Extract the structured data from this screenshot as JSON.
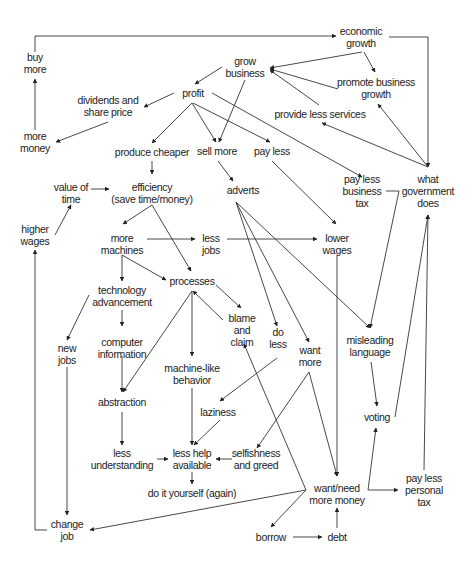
{
  "diagram": {
    "type": "causal-loop concept map",
    "nodes": [
      {
        "id": "economic_growth",
        "label": "economic\ngrowth",
        "x": 361,
        "y": 37
      },
      {
        "id": "buy_more",
        "label": "buy\nmore",
        "x": 35,
        "y": 63
      },
      {
        "id": "grow_business",
        "label": "grow\nbusiness",
        "x": 245,
        "y": 67
      },
      {
        "id": "promote_business_growth",
        "label": "promote business\ngrowth",
        "x": 376,
        "y": 88
      },
      {
        "id": "profit",
        "label": "profit",
        "x": 193,
        "y": 93
      },
      {
        "id": "dividends",
        "label": "dividends and\nshare price",
        "x": 108,
        "y": 106
      },
      {
        "id": "provide_less_services",
        "label": "provide less services",
        "x": 320,
        "y": 114
      },
      {
        "id": "more_money",
        "label": "more\nmoney",
        "x": 35,
        "y": 142
      },
      {
        "id": "produce_cheaper",
        "label": "produce cheaper",
        "x": 152,
        "y": 152
      },
      {
        "id": "sell_more",
        "label": "sell more",
        "x": 217,
        "y": 151
      },
      {
        "id": "pay_less",
        "label": "pay less",
        "x": 272,
        "y": 151
      },
      {
        "id": "pay_less_business_tax",
        "label": "pay less\nbusiness\ntax",
        "x": 362,
        "y": 191
      },
      {
        "id": "what_government_does",
        "label": "what\ngovernment\ndoes",
        "x": 428,
        "y": 191
      },
      {
        "id": "value_of_time",
        "label": "value of\ntime",
        "x": 71,
        "y": 193
      },
      {
        "id": "efficiency",
        "label": "efficiency\n(save time/money)",
        "x": 152,
        "y": 193
      },
      {
        "id": "adverts",
        "label": "adverts",
        "x": 243,
        "y": 190
      },
      {
        "id": "higher_wages",
        "label": "higher\nwages",
        "x": 35,
        "y": 235
      },
      {
        "id": "more_machines",
        "label": "more\nmachines",
        "x": 122,
        "y": 244
      },
      {
        "id": "less_jobs",
        "label": "less\njobs",
        "x": 211,
        "y": 244
      },
      {
        "id": "lower_wages",
        "label": "lower\nwages",
        "x": 337,
        "y": 244
      },
      {
        "id": "processes",
        "label": "processes",
        "x": 192,
        "y": 281
      },
      {
        "id": "technology_advancement",
        "label": "technology\nadvancement",
        "x": 122,
        "y": 296
      },
      {
        "id": "blame_and_claim",
        "label": "blame\nand\nclaim",
        "x": 242,
        "y": 330
      },
      {
        "id": "do_less",
        "label": "do\nless",
        "x": 278,
        "y": 338
      },
      {
        "id": "want_more",
        "label": "want\nmore",
        "x": 310,
        "y": 356
      },
      {
        "id": "misleading_language",
        "label": "misleading\nlanguage",
        "x": 370,
        "y": 346
      },
      {
        "id": "new_jobs",
        "label": "new\njobs",
        "x": 67,
        "y": 354
      },
      {
        "id": "computer_information",
        "label": "computer\ninformation",
        "x": 122,
        "y": 348
      },
      {
        "id": "machine_like_behavior",
        "label": "machine-like\nbehavior",
        "x": 192,
        "y": 374
      },
      {
        "id": "abstraction",
        "label": "abstraction",
        "x": 122,
        "y": 402
      },
      {
        "id": "laziness",
        "label": "laziness",
        "x": 218,
        "y": 412
      },
      {
        "id": "voting",
        "label": "voting",
        "x": 377,
        "y": 417
      },
      {
        "id": "less_understanding",
        "label": "less\nunderstanding",
        "x": 122,
        "y": 459
      },
      {
        "id": "less_help_available",
        "label": "less help\navailable",
        "x": 192,
        "y": 459
      },
      {
        "id": "selfishness_and_greed",
        "label": "selfishness\nand greed",
        "x": 256,
        "y": 459
      },
      {
        "id": "do_it_yourself",
        "label": "do it yourself (again)",
        "x": 192,
        "y": 493
      },
      {
        "id": "want_need_more_money",
        "label": "want/need\nmore money",
        "x": 337,
        "y": 494
      },
      {
        "id": "pay_less_personal_tax",
        "label": "pay less\npersonal\ntax",
        "x": 424,
        "y": 490
      },
      {
        "id": "change_job",
        "label": "change\njob",
        "x": 67,
        "y": 530
      },
      {
        "id": "borrow",
        "label": "borrow",
        "x": 271,
        "y": 537
      },
      {
        "id": "debt",
        "label": "debt",
        "x": 337,
        "y": 537
      }
    ],
    "edges": [
      {
        "from": "buy_more",
        "to": "economic_growth",
        "path": "M35,52 L35,36 L336,36",
        "arrow": "end"
      },
      {
        "from": "economic_growth",
        "to": "what_government_does",
        "path": "M389,37 L428,37 L428,167",
        "arrow": "end"
      },
      {
        "from": "economic_growth",
        "to": "grow_business",
        "path": "M362,52 L270,68",
        "arrow": "end"
      },
      {
        "from": "economic_growth",
        "to": "promote_business_growth",
        "path": "M364,52 L375,72",
        "arrow": "end"
      },
      {
        "from": "promote_business_growth",
        "to": "grow_business",
        "path": "M338,89 L270,69",
        "arrow": "end"
      },
      {
        "from": "provide_less_services",
        "to": "grow_business",
        "path": "M319,105 L270,70",
        "arrow": "end"
      },
      {
        "from": "what_government_does",
        "to": "promote_business_growth",
        "path": "M428,167 L378,104",
        "arrow": "end"
      },
      {
        "from": "what_government_does",
        "to": "provide_less_services",
        "path": "M428,167 L322,123",
        "arrow": "end"
      },
      {
        "from": "grow_business",
        "to": "profit",
        "path": "M222,67 L195,84",
        "arrow": "end"
      },
      {
        "from": "grow_business",
        "to": "sell_more",
        "path": "M245,80 L219,142",
        "arrow": "end"
      },
      {
        "from": "profit",
        "to": "dividends",
        "path": "M174,93 L144,107",
        "arrow": "end"
      },
      {
        "from": "dividends",
        "to": "more_money",
        "path": "M108,122 L56,142",
        "arrow": "end"
      },
      {
        "from": "more_money",
        "to": "buy_more",
        "path": "M35,130 L35,79",
        "arrow": "end"
      },
      {
        "from": "profit",
        "to": "produce_cheaper",
        "path": "M192,103 L152,143",
        "arrow": "end"
      },
      {
        "from": "profit",
        "to": "sell_more",
        "path": "M192,103 L216,142",
        "arrow": "end"
      },
      {
        "from": "profit",
        "to": "pay_less",
        "path": "M193,103 L270,142",
        "arrow": "end"
      },
      {
        "from": "profit",
        "to": "pay_less_business_tax",
        "path": "M212,93 L362,177",
        "arrow": "end"
      },
      {
        "from": "produce_cheaper",
        "to": "efficiency",
        "path": "M152,161 L152,174",
        "arrow": "end"
      },
      {
        "from": "sell_more",
        "to": "adverts",
        "path": "M218,161 L233,181",
        "arrow": "end"
      },
      {
        "from": "pay_less",
        "to": "lower_wages",
        "path": "M272,161 L336,224",
        "arrow": "end"
      },
      {
        "from": "higher_wages",
        "to": "value_of_time",
        "path": "M55,235 L71,205",
        "arrow": "end"
      },
      {
        "from": "value_of_time",
        "to": "efficiency",
        "path": "M91,189 L109,189",
        "arrow": "end"
      },
      {
        "from": "efficiency",
        "to": "more_machines",
        "path": "M152,205 L123,224",
        "arrow": "end"
      },
      {
        "from": "efficiency",
        "to": "processes",
        "path": "M152,205 L191,271",
        "arrow": "end"
      },
      {
        "from": "more_machines",
        "to": "less_jobs",
        "path": "M147,239 L195,239",
        "arrow": "end"
      },
      {
        "from": "less_jobs",
        "to": "lower_wages",
        "path": "M227,239 L317,239",
        "arrow": "end"
      },
      {
        "from": "more_machines",
        "to": "technology_advancement",
        "path": "M122,255 L122,281",
        "arrow": "end"
      },
      {
        "from": "more_machines",
        "to": "processes",
        "path": "M122,255 L166,280",
        "arrow": "end"
      },
      {
        "from": "technology_advancement",
        "to": "computer_information",
        "path": "M122,310 L122,326",
        "arrow": "end"
      },
      {
        "from": "technology_advancement",
        "to": "new_jobs",
        "path": "M89,295 L67,340",
        "arrow": "end"
      },
      {
        "from": "computer_information",
        "to": "abstraction",
        "path": "M122,356 L122,392",
        "arrow": "end"
      },
      {
        "from": "processes",
        "to": "abstraction",
        "path": "M192,291 L123,392",
        "arrow": "end"
      },
      {
        "from": "processes",
        "to": "machine_like_behavior",
        "path": "M192,291 L192,356",
        "arrow": "end"
      },
      {
        "from": "processes",
        "to": "blame_and_claim",
        "path": "M216,285 L241,308",
        "arrow": "end"
      },
      {
        "from": "blame_and_claim",
        "to": "processes",
        "path": "M223,320 L193,291",
        "arrow": "end"
      },
      {
        "from": "adverts",
        "to": "do_less",
        "path": "M236,202 L277,326",
        "arrow": "end"
      },
      {
        "from": "adverts",
        "to": "want_more",
        "path": "M236,202 L309,342",
        "arrow": "end"
      },
      {
        "from": "adverts",
        "to": "misleading_language",
        "path": "M236,202 L370,328",
        "arrow": "end"
      },
      {
        "from": "pay_less_business_tax",
        "to": "misleading_language",
        "path": "M386,191 L399,191 L370,328",
        "arrow": "end"
      },
      {
        "from": "do_less",
        "to": "laziness",
        "path": "M277,358 L220,401",
        "arrow": "end"
      },
      {
        "from": "want_more",
        "to": "selfishness_and_greed",
        "path": "M309,372 L257,448",
        "arrow": "end"
      },
      {
        "from": "want_more",
        "to": "want_need_more_money",
        "path": "M309,372 L337,476",
        "arrow": "end"
      },
      {
        "from": "machine_like_behavior",
        "to": "less_help_available",
        "path": "M192,388 L192,445",
        "arrow": "end"
      },
      {
        "from": "laziness",
        "to": "less_help_available",
        "path": "M220,420 L194,445",
        "arrow": "end"
      },
      {
        "from": "abstraction",
        "to": "less_understanding",
        "path": "M122,412 L122,445",
        "arrow": "end"
      },
      {
        "from": "less_understanding",
        "to": "less_help_available",
        "path": "M157,459 L168,459",
        "arrow": "end"
      },
      {
        "from": "selfishness_and_greed",
        "to": "less_help_available",
        "path": "M232,459 L216,459",
        "arrow": "end"
      },
      {
        "from": "less_help_available",
        "to": "do_it_yourself",
        "path": "M192,472 L192,484",
        "arrow": "end"
      },
      {
        "from": "lower_wages",
        "to": "want_need_more_money",
        "path": "M337,256 L337,476",
        "arrow": "end"
      },
      {
        "from": "misleading_language",
        "to": "voting",
        "path": "M371,362 L377,406",
        "arrow": "end"
      },
      {
        "from": "voting",
        "to": "what_government_does",
        "path": "M395,417 L428,215",
        "arrow": "end"
      },
      {
        "from": "pay_less_personal_tax",
        "to": "what_government_does",
        "path": "M424,470 L428,215",
        "arrow": "end"
      },
      {
        "from": "want_need_more_money",
        "to": "voting",
        "path": "M368,490 L376,428",
        "arrow": "end"
      },
      {
        "from": "want_need_more_money",
        "to": "pay_less_personal_tax",
        "path": "M368,490 L398,490",
        "arrow": "end"
      },
      {
        "from": "want_need_more_money",
        "to": "blame_and_claim",
        "path": "M306,490 L244,344",
        "arrow": "end"
      },
      {
        "from": "want_need_more_money",
        "to": "change_job",
        "path": "M306,490 L90,530",
        "arrow": "end"
      },
      {
        "from": "want_need_more_money",
        "to": "borrow",
        "path": "M306,490 L271,527",
        "arrow": "end"
      },
      {
        "from": "borrow",
        "to": "debt",
        "path": "M293,537 L322,537",
        "arrow": "end"
      },
      {
        "from": "debt",
        "to": "want_need_more_money",
        "path": "M337,528 L337,508",
        "arrow": "end"
      },
      {
        "from": "new_jobs",
        "to": "change_job",
        "path": "M67,367 L67,515",
        "arrow": "end"
      },
      {
        "from": "change_job",
        "to": "higher_wages",
        "path": "M47,530 L35,530 L35,250",
        "arrow": "end"
      }
    ]
  }
}
